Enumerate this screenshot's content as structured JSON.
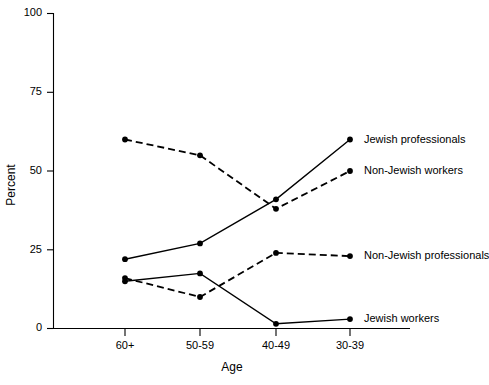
{
  "chart_data": {
    "type": "line",
    "title": "",
    "xlabel": "Age",
    "ylabel": "Percent",
    "categories": [
      "60+",
      "50-59",
      "40-49",
      "30-39"
    ],
    "ylim": [
      0,
      100
    ],
    "yticks": [
      0,
      25,
      50,
      75,
      100
    ],
    "ytick_labels": [
      "0",
      "25",
      "50",
      "75",
      "100"
    ],
    "grid": false,
    "legend_position": "right-inline-labels",
    "series": [
      {
        "name": "Jewish professionals",
        "style": "solid",
        "marker": "filled-circle",
        "color": "#000000",
        "values": [
          22,
          27,
          41,
          60
        ]
      },
      {
        "name": "Non-Jewish workers",
        "style": "dashed",
        "marker": "filled-circle",
        "color": "#000000",
        "values": [
          60,
          55,
          38,
          50
        ]
      },
      {
        "name": "Non-Jewish professionals",
        "style": "dashed",
        "marker": "filled-circle",
        "color": "#000000",
        "values": [
          16,
          10,
          24,
          23
        ]
      },
      {
        "name": "Jewish workers",
        "style": "solid",
        "marker": "filled-circle",
        "color": "#000000",
        "values": [
          15,
          17.5,
          1.5,
          3
        ]
      }
    ]
  },
  "axes": {
    "y_tick_labels": [
      "100",
      "75",
      "50",
      "25",
      "0"
    ],
    "x_tick_labels": [
      "60+",
      "50-59",
      "40-49",
      "30-39"
    ],
    "y_axis_title": "Percent",
    "x_axis_title": "Age"
  },
  "series_labels": {
    "jewish_professionals": "Jewish professionals",
    "non_jewish_workers": "Non-Jewish workers",
    "non_jewish_professionals": "Non-Jewish professionals",
    "jewish_workers": "Jewish workers"
  }
}
